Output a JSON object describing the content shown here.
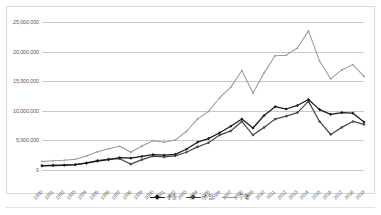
{
  "chart_data": {
    "type": "line",
    "title": "",
    "xlabel": "",
    "ylabel": "",
    "ylim": [
      0,
      25000000
    ],
    "ytick_values": [
      0,
      5000000,
      10000000,
      15000000,
      20000000,
      25000000
    ],
    "ytick_labels": [
      "0",
      "5,000,000",
      "10,000,000",
      "15,000,000",
      "20,000,000",
      "25,000,000"
    ],
    "grid": true,
    "legend_position": "bottom",
    "categories": [
      "1990",
      "1991",
      "1992",
      "1993",
      "1994",
      "1995",
      "1996",
      "1997",
      "1998",
      "1999",
      "2000",
      "2001",
      "2002",
      "2003",
      "2004",
      "2005",
      "2006",
      "2007",
      "2008",
      "2009",
      "2010",
      "2011",
      "2012",
      "2013",
      "2014",
      "2015",
      "2016",
      "2017",
      "2018",
      "2019"
    ],
    "series": [
      {
        "name": "수출",
        "color": "#1a1a1a",
        "marker": "diamond",
        "values": [
          700000,
          750000,
          800000,
          900000,
          1150000,
          1500000,
          1750000,
          2100000,
          2000000,
          2300000,
          2600000,
          2500000,
          2650000,
          3500000,
          4700000,
          5300000,
          6300000,
          7400000,
          8600000,
          7100000,
          9200000,
          10700000,
          10300000,
          10900000,
          11900000,
          10200000,
          9400000,
          9700000,
          9600000,
          8100000
        ]
      },
      {
        "name": "수입",
        "color": "#4a4a4a",
        "marker": "diamond",
        "values": [
          750000,
          820000,
          850000,
          900000,
          1200000,
          1600000,
          1850000,
          1900000,
          1000000,
          1750000,
          2350000,
          2200000,
          2400000,
          3000000,
          3900000,
          4600000,
          5900000,
          6600000,
          8200000,
          5900000,
          7200000,
          8600000,
          9100000,
          9700000,
          11600000,
          8200000,
          6000000,
          7200000,
          8200000,
          7700000
        ]
      },
      {
        "name": "무역",
        "color": "#9a9a9a",
        "marker": "none",
        "values": [
          1450000,
          1570000,
          1650000,
          1800000,
          2350000,
          3100000,
          3600000,
          4000000,
          3000000,
          4050000,
          4950000,
          4700000,
          5050000,
          6500000,
          8600000,
          9900000,
          12200000,
          14000000,
          16800000,
          13000000,
          16400000,
          19300000,
          19400000,
          20600000,
          23500000,
          18400000,
          15400000,
          16900000,
          17800000,
          15800000
        ]
      }
    ]
  },
  "legend": {
    "items": [
      {
        "label": "수출"
      },
      {
        "label": "수입"
      },
      {
        "label": "무역"
      }
    ]
  }
}
